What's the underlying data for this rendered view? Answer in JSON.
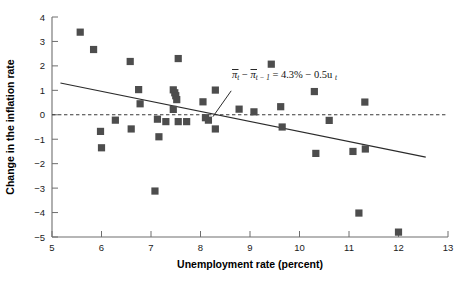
{
  "chart_data": {
    "type": "scatter",
    "title": "",
    "xlabel": "Unemployment rate (percent)",
    "ylabel": "Change in the inflation rate",
    "xlim": [
      5,
      13
    ],
    "ylim": [
      -5,
      4
    ],
    "xticks": [
      5,
      6,
      7,
      8,
      9,
      10,
      11,
      12,
      13
    ],
    "xticklabels": [
      "5",
      "6",
      "7",
      "8",
      "9",
      "10",
      "11",
      "12",
      "13"
    ],
    "yticks": [
      4,
      3,
      2,
      1,
      0,
      -1,
      -2,
      -3,
      -4,
      -5
    ],
    "yticklabels": [
      "4",
      "3",
      "2",
      "1",
      "0",
      "−1",
      "−2",
      "−3",
      "−4",
      "−5"
    ],
    "grid": false,
    "legend": null,
    "marker": "square",
    "marker_color": "#4d4d4d",
    "points": [
      {
        "x": 5.57,
        "y": 3.38
      },
      {
        "x": 5.84,
        "y": 2.67
      },
      {
        "x": 5.98,
        "y": -0.68
      },
      {
        "x": 6.0,
        "y": -1.35
      },
      {
        "x": 6.28,
        "y": -0.22
      },
      {
        "x": 6.58,
        "y": 2.18
      },
      {
        "x": 6.6,
        "y": -0.58
      },
      {
        "x": 6.75,
        "y": 1.03
      },
      {
        "x": 6.78,
        "y": 0.45
      },
      {
        "x": 7.08,
        "y": -3.12
      },
      {
        "x": 7.13,
        "y": -0.18
      },
      {
        "x": 7.16,
        "y": -0.9
      },
      {
        "x": 7.3,
        "y": -0.28
      },
      {
        "x": 7.45,
        "y": 1.02
      },
      {
        "x": 7.45,
        "y": 0.22
      },
      {
        "x": 7.48,
        "y": 0.9
      },
      {
        "x": 7.5,
        "y": 0.78
      },
      {
        "x": 7.52,
        "y": 0.62
      },
      {
        "x": 7.55,
        "y": 2.3
      },
      {
        "x": 7.55,
        "y": -0.28
      },
      {
        "x": 7.72,
        "y": -0.28
      },
      {
        "x": 8.05,
        "y": 0.53
      },
      {
        "x": 8.1,
        "y": -0.12
      },
      {
        "x": 8.16,
        "y": -0.22
      },
      {
        "x": 8.3,
        "y": 1.01
      },
      {
        "x": 8.3,
        "y": -0.58
      },
      {
        "x": 8.78,
        "y": 0.23
      },
      {
        "x": 9.08,
        "y": 0.12
      },
      {
        "x": 9.43,
        "y": 2.07
      },
      {
        "x": 9.62,
        "y": 0.33
      },
      {
        "x": 9.65,
        "y": -0.5
      },
      {
        "x": 10.3,
        "y": 0.95
      },
      {
        "x": 10.33,
        "y": -1.58
      },
      {
        "x": 10.6,
        "y": -0.23
      },
      {
        "x": 11.08,
        "y": -1.5
      },
      {
        "x": 11.2,
        "y": -4.02
      },
      {
        "x": 11.32,
        "y": 0.52
      },
      {
        "x": 11.33,
        "y": -1.4
      },
      {
        "x": 12.0,
        "y": -4.8
      }
    ],
    "zero_line": {
      "y": 0,
      "style": "dashed",
      "color": "#3a3a3a"
    },
    "regression_line": {
      "x1": 5.17,
      "y1": 1.3,
      "x2": 12.55,
      "y2": -1.73,
      "color": "#2b2b2b",
      "style": "solid"
    },
    "annotation": {
      "equation_parts": {
        "pi1": "π",
        "sub1": "t",
        "minus1": "−",
        "pi2": "π",
        "sub2": "t − 1",
        "equals": "=",
        "intercept": "4.3%",
        "minus2": "−",
        "slope": "0.5",
        "u": "u",
        "sub3": "t"
      },
      "equation_plain": "πt − πt−1 = 4.3% − 0.5ut",
      "leader_from": {
        "x": 8.62,
        "y": 0.98
      },
      "leader_to": {
        "x": 8.25,
        "y": -0.08
      }
    }
  }
}
